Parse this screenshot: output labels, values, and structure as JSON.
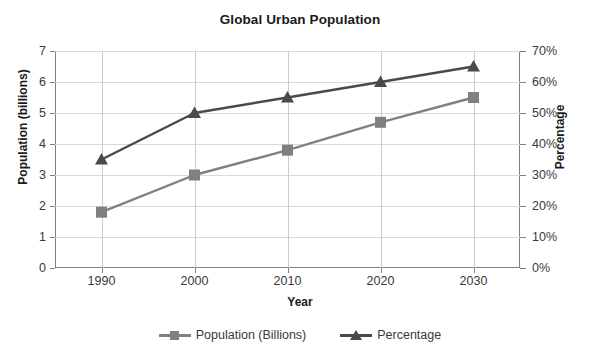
{
  "chart_data": {
    "type": "line",
    "title": "Global Urban Population",
    "xlabel": "Year",
    "ylabel": "Population (billions)",
    "y2label": "Percentage",
    "categories": [
      "1990",
      "2000",
      "2010",
      "2020",
      "2030"
    ],
    "x": [
      1990,
      2000,
      2010,
      2020,
      2030
    ],
    "series": [
      {
        "name": "Population (Billions)",
        "axis": "left",
        "marker": "square",
        "color": "#808080",
        "values": [
          1.8,
          3.0,
          3.8,
          4.7,
          5.5
        ]
      },
      {
        "name": "Percentage",
        "axis": "right",
        "marker": "triangle",
        "color": "#4a4a4a",
        "values": [
          35,
          50,
          55,
          60,
          65
        ]
      }
    ],
    "ylim": [
      0,
      7
    ],
    "yticks": [
      "0",
      "1",
      "2",
      "3",
      "4",
      "5",
      "6",
      "7"
    ],
    "y2lim": [
      0,
      70
    ],
    "y2ticks": [
      "0%",
      "10%",
      "20%",
      "30%",
      "40%",
      "50%",
      "60%",
      "70%"
    ],
    "grid": true,
    "legend_position": "bottom"
  },
  "legend": {
    "items": [
      {
        "label": "Population (Billions)",
        "color": "#808080",
        "marker": "square"
      },
      {
        "label": "Percentage",
        "color": "#4a4a4a",
        "marker": "triangle"
      }
    ]
  },
  "clipped_top_text": ""
}
